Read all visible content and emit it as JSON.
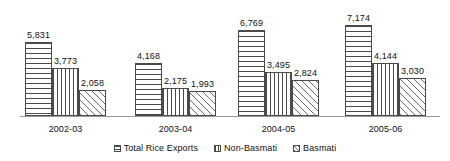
{
  "chart_data": {
    "type": "bar",
    "title": "",
    "subtitle": "",
    "xlabel": "",
    "ylabel": "",
    "grid": false,
    "legend_position": "bottom",
    "axis_visible": {
      "x": true,
      "y": false
    },
    "ylim": [
      0,
      7600
    ],
    "categories": [
      "2002-03",
      "2003-04",
      "2004-05",
      "2005-06"
    ],
    "series": [
      {
        "name": "Total Rice Exports",
        "pattern": "horizontal-lines",
        "values": [
          5831,
          3773,
          2058,
          4168
        ]
      },
      {
        "name": "Non-Basmati",
        "pattern": "vertical-lines",
        "values": [
          2175,
          1993,
          6769,
          3495
        ]
      },
      {
        "name": "Basmati",
        "pattern": "diagonal-hatch",
        "values": [
          2824,
          7174,
          4144,
          3030
        ]
      }
    ],
    "groups": [
      {
        "category": "2002-03",
        "bars": [
          {
            "series": "Total Rice Exports",
            "value": 5831,
            "label": "5,831"
          },
          {
            "series": "Non-Basmati",
            "value": 3773,
            "label": "3,773"
          },
          {
            "series": "Basmati",
            "value": 2058,
            "label": "2,058"
          }
        ]
      },
      {
        "category": "2003-04",
        "bars": [
          {
            "series": "Total Rice Exports",
            "value": 4168,
            "label": "4,168"
          },
          {
            "series": "Non-Basmati",
            "value": 2175,
            "label": "2,175"
          },
          {
            "series": "Basmati",
            "value": 1993,
            "label": "1,993"
          }
        ]
      },
      {
        "category": "2004-05",
        "bars": [
          {
            "series": "Total Rice Exports",
            "value": 6769,
            "label": "6,769"
          },
          {
            "series": "Non-Basmati",
            "value": 3495,
            "label": "3,495"
          },
          {
            "series": "Basmati",
            "value": 2824,
            "label": "2,824"
          }
        ]
      },
      {
        "category": "2005-06",
        "bars": [
          {
            "series": "Total Rice Exports",
            "value": 7174,
            "label": "7,174"
          },
          {
            "series": "Non-Basmati",
            "value": 4144,
            "label": "4,144"
          },
          {
            "series": "Basmati",
            "value": 3030,
            "label": "3,030"
          }
        ]
      }
    ],
    "legend": [
      {
        "label": "Total Rice Exports",
        "pattern": "horizontal-lines"
      },
      {
        "label": "Non-Basmati",
        "pattern": "vertical-lines"
      },
      {
        "label": "Basmati",
        "pattern": "diagonal-hatch"
      }
    ],
    "colors": {
      "bar_outline": "#4a4a4a",
      "bar_fill": "#ffffff",
      "pattern_line": "#4a4a4a",
      "axis": "#9a9a9a",
      "text": "#111111",
      "background": "#ffffff"
    }
  },
  "x_labels": {
    "0": "2002-03",
    "1": "2003-04",
    "2": "2004-05",
    "3": "2005-06"
  }
}
